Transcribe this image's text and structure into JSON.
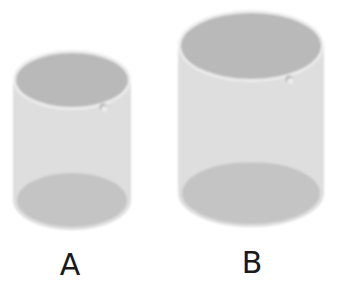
{
  "figure": {
    "colors": {
      "background": "#ffffff",
      "body": "#dedede",
      "rim": "#ececec",
      "interior": "#b9b9b9",
      "base": "#c4c4c4",
      "label": "#1a1a1a"
    },
    "beakers": [
      {
        "id": "A",
        "label": "A",
        "cx": 72,
        "left": 13,
        "right": 131,
        "top_cy": 80,
        "top_ry": 30,
        "bottom_cy": 200,
        "bottom_ry": 30,
        "spout_x": 103,
        "spout_y": 108,
        "label_x": 70,
        "label_y": 250
      },
      {
        "id": "B",
        "label": "B",
        "cx": 251,
        "left": 178,
        "right": 324,
        "top_cy": 46,
        "top_ry": 36,
        "bottom_cy": 193,
        "bottom_ry": 34,
        "spout_x": 289,
        "spout_y": 80,
        "label_x": 252,
        "label_y": 248
      }
    ]
  }
}
